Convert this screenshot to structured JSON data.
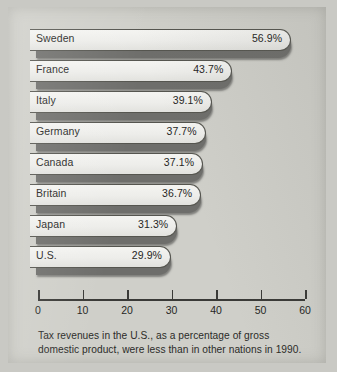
{
  "caption": "Tax revenues in the U.S., as a percentage of gross domestic product, were less than in other nations in 1990.",
  "colors": {
    "page_background": "#c9c9c4",
    "panel_background": "#cfcfc9",
    "bar_body": "#eeeeea",
    "bar_shadow": "#6e6e6b",
    "bar_outline": "#55554f",
    "axis": "#3a3a37",
    "text": "#262624"
  },
  "chart_data": {
    "type": "bar",
    "orientation": "horizontal",
    "title": "",
    "subtitle": "",
    "xlabel": "",
    "ylabel": "",
    "xlim": [
      0,
      60
    ],
    "xticks": [
      0,
      10,
      20,
      30,
      40,
      50,
      60
    ],
    "xtick_labels": [
      "0",
      "10",
      "20",
      "30",
      "40",
      "50",
      "60"
    ],
    "grid": false,
    "legend": false,
    "value_suffix": "%",
    "categories": [
      "Sweden",
      "France",
      "Italy",
      "Germany",
      "Canada",
      "Britain",
      "Japan",
      "U.S."
    ],
    "values": [
      56.9,
      43.7,
      39.1,
      37.7,
      37.1,
      36.7,
      31.3,
      29.9
    ],
    "value_labels": [
      "56.9%",
      "43.7%",
      "39.1%",
      "37.7%",
      "37.1%",
      "36.7%",
      "31.3%",
      "29.9%"
    ],
    "annotation": "Tax revenues in the U.S., as a percentage of gross domestic product, were less than in other nations in 1990."
  }
}
